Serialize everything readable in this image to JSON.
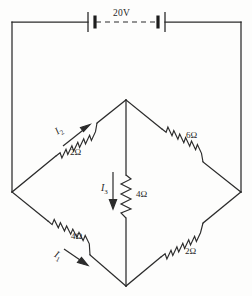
{
  "diagram": {
    "source": {
      "label": "20V",
      "name": "battery-pair"
    },
    "components": [
      {
        "id": "r-top-left",
        "label": "2Ω",
        "value": 2,
        "unit": "ohm",
        "orientation": "diagonal-up-right"
      },
      {
        "id": "r-top-right",
        "label": "6Ω",
        "value": 6,
        "unit": "ohm",
        "orientation": "diagonal-down-right"
      },
      {
        "id": "r-middle",
        "label": "4Ω",
        "value": 4,
        "unit": "ohm",
        "orientation": "vertical"
      },
      {
        "id": "r-bottom-left",
        "label": "4Ω",
        "value": 4,
        "unit": "ohm",
        "orientation": "diagonal-down-right"
      },
      {
        "id": "r-bottom-right",
        "label": "2Ω",
        "value": 2,
        "unit": "ohm",
        "orientation": "diagonal-up-right"
      }
    ],
    "currents": [
      {
        "id": "i1",
        "symbol": "I",
        "subscript": "1",
        "direction": "down-right",
        "branch": "r-bottom-left"
      },
      {
        "id": "i2",
        "symbol": "I",
        "subscript": "2",
        "direction": "up-right",
        "branch": "r-top-left"
      },
      {
        "id": "i3",
        "symbol": "I",
        "subscript": "3",
        "direction": "down",
        "branch": "r-middle"
      }
    ],
    "colors": {
      "ink": "#2b2b2b",
      "paper": "#fdfdfc"
    }
  }
}
